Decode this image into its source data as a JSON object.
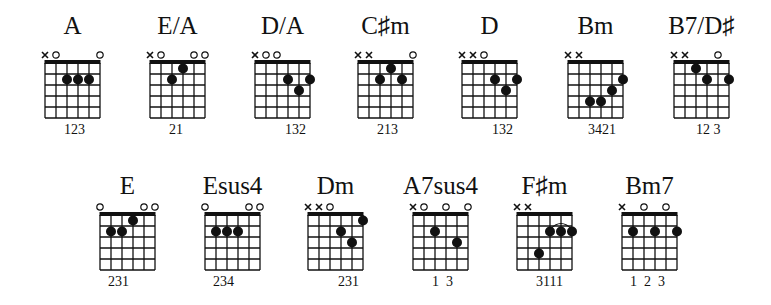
{
  "chart_title": "",
  "layout": {
    "strings": 6,
    "frets": 5
  },
  "chords": [
    {
      "name": "A",
      "row": 0,
      "x": 45,
      "markers": [
        "x",
        "o",
        "",
        "",
        "",
        "o"
      ],
      "dots": [
        [
          3,
          2
        ],
        [
          4,
          2
        ],
        [
          5,
          2
        ]
      ],
      "barres": [],
      "fingers": "123",
      "fingers_x": 19
    },
    {
      "name": "E/A",
      "row": 0,
      "x": 150,
      "markers": [
        "x",
        "o",
        "",
        "",
        "o",
        "o"
      ],
      "dots": [
        [
          3,
          2
        ],
        [
          4,
          1
        ]
      ],
      "barres": [],
      "fingers": "21",
      "fingers_x": 19
    },
    {
      "name": "D/A",
      "row": 0,
      "x": 255,
      "markers": [
        "x",
        "o",
        "o",
        "",
        "",
        ""
      ],
      "dots": [
        [
          4,
          2
        ],
        [
          5,
          3
        ],
        [
          6,
          2
        ]
      ],
      "barres": [],
      "fingers": "132",
      "fingers_x": 30
    },
    {
      "name": "C♯m",
      "row": 0,
      "x": 358,
      "markers": [
        "x",
        "x",
        "",
        "",
        "",
        "o"
      ],
      "dots": [
        [
          3,
          2
        ],
        [
          4,
          1
        ],
        [
          5,
          2
        ]
      ],
      "barres": [],
      "fingers": "213",
      "fingers_x": 19
    },
    {
      "name": "D",
      "row": 0,
      "x": 462,
      "markers": [
        "x",
        "x",
        "o",
        "",
        "",
        ""
      ],
      "dots": [
        [
          4,
          2
        ],
        [
          5,
          3
        ],
        [
          6,
          2
        ]
      ],
      "barres": [],
      "fingers": "132",
      "fingers_x": 30
    },
    {
      "name": "Bm",
      "row": 0,
      "x": 568,
      "markers": [
        "x",
        "x",
        "",
        "",
        "",
        ""
      ],
      "dots": [
        [
          3,
          4
        ],
        [
          4,
          4
        ],
        [
          5,
          3
        ],
        [
          6,
          2
        ]
      ],
      "barres": [],
      "fingers": "3421",
      "fingers_x": 20
    },
    {
      "name": "B7/D♯",
      "row": 0,
      "x": 674,
      "markers": [
        "x",
        "x",
        "",
        "",
        "o",
        ""
      ],
      "dots": [
        [
          3,
          1
        ],
        [
          4,
          2
        ],
        [
          6,
          2
        ]
      ],
      "barres": [],
      "fingers": "12 3",
      "fingers_x": 22
    },
    {
      "name": "E",
      "row": 1,
      "x": 100,
      "markers": [
        "o",
        "",
        "",
        "",
        "o",
        "o"
      ],
      "dots": [
        [
          2,
          2
        ],
        [
          3,
          2
        ],
        [
          4,
          1
        ]
      ],
      "barres": [],
      "fingers": "231",
      "fingers_x": 8
    },
    {
      "name": "Esus4",
      "row": 1,
      "x": 205,
      "markers": [
        "o",
        "",
        "",
        "",
        "o",
        "o"
      ],
      "dots": [
        [
          2,
          2
        ],
        [
          3,
          2
        ],
        [
          4,
          2
        ]
      ],
      "barres": [],
      "fingers": "234",
      "fingers_x": 8
    },
    {
      "name": "Dm",
      "row": 1,
      "x": 308,
      "markers": [
        "x",
        "x",
        "o",
        "",
        "",
        ""
      ],
      "dots": [
        [
          4,
          2
        ],
        [
          5,
          3
        ],
        [
          6,
          1
        ]
      ],
      "barres": [],
      "fingers": "231",
      "fingers_x": 30
    },
    {
      "name": "A7sus4",
      "row": 1,
      "x": 413,
      "markers": [
        "x",
        "o",
        "",
        "o",
        "",
        "o"
      ],
      "dots": [
        [
          3,
          2
        ],
        [
          5,
          3
        ]
      ],
      "barres": [],
      "fingers": "1  3",
      "fingers_x": 19
    },
    {
      "name": "F♯m",
      "row": 1,
      "x": 517,
      "markers": [
        "x",
        "x",
        "",
        "",
        "",
        ""
      ],
      "dots": [
        [
          3,
          4
        ],
        [
          4,
          2
        ],
        [
          5,
          2
        ],
        [
          6,
          2
        ]
      ],
      "barres": [
        [
          4,
          6,
          2
        ]
      ],
      "fingers": "3111",
      "fingers_x": 19
    },
    {
      "name": "Bm7",
      "row": 1,
      "x": 622,
      "markers": [
        "x",
        "",
        "o",
        "",
        "o",
        ""
      ],
      "dots": [
        [
          2,
          2
        ],
        [
          4,
          2
        ],
        [
          6,
          2
        ]
      ],
      "barres": [],
      "fingers": "1  2  3",
      "fingers_x": 8
    }
  ],
  "rows": [
    {
      "name_top": 12,
      "grid_top": 63
    },
    {
      "name_top": 172,
      "grid_top": 215
    }
  ],
  "colors": {
    "ink": "#111111",
    "background": "#ffffff"
  }
}
